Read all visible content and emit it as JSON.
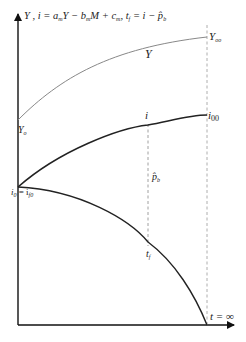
{
  "diagram": {
    "axis_title": {
      "main": "Y , i = a",
      "sub1": "m",
      "mid1": "Y − b",
      "sub2": "m",
      "mid2": "M + c",
      "sub3": "m",
      "mid3": ", t",
      "sub4": "f",
      "mid4": " = i − p̂",
      "sub5": "b"
    },
    "labels": {
      "y_inf": "Y",
      "y_inf_sub": "oo",
      "y_curve": "Y",
      "y0": "Y",
      "y0_sub": "o",
      "i": "i",
      "i00": "i",
      "i00_sub": "00",
      "i0": "i",
      "i0_sub": "0",
      "i0_eq": " = i",
      "i0_eq_sub": "f0",
      "pb": "p̂",
      "pb_sub": "b",
      "tf": "t",
      "tf_sub": "f",
      "t_inf": "t = ∞"
    },
    "curves": [
      {
        "name": "Y",
        "start": "Y_o",
        "end": "Y_oo",
        "shape": "concave rising",
        "color": "#888888"
      },
      {
        "name": "i",
        "start": "i_0 = i_f0",
        "end": "i_00",
        "shape": "concave rising",
        "color": "#222222"
      },
      {
        "name": "t_f",
        "start": "i_0 = i_f0",
        "end": "t = ∞ on x-axis",
        "shape": "concave falling",
        "color": "#222222"
      }
    ],
    "markers": [
      {
        "name": "p_b gap",
        "type": "dashed vertical",
        "between": [
          "i",
          "t_f"
        ]
      },
      {
        "name": "t = ∞",
        "type": "dashed vertical",
        "at": "asymptote"
      }
    ]
  }
}
